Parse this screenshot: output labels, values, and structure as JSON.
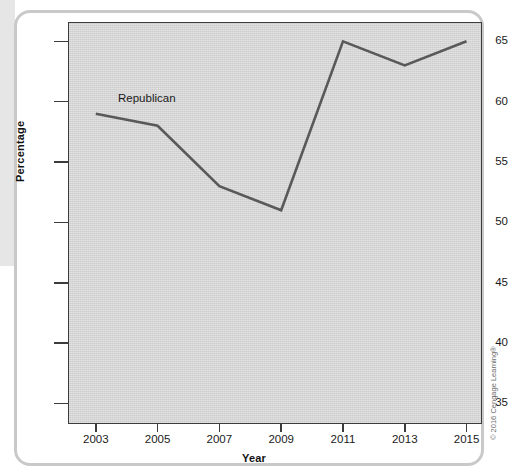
{
  "chart_data": {
    "type": "line",
    "title": "",
    "xlabel": "Year",
    "ylabel": "Percentage",
    "x": [
      2003,
      2005,
      2007,
      2009,
      2011,
      2013,
      2015
    ],
    "xtick_labels": [
      "2003",
      "2005",
      "2007",
      "2009",
      "2011",
      "2013",
      "2015"
    ],
    "ytick_labels": [
      "35",
      "40",
      "45",
      "50",
      "55",
      "60",
      "65"
    ],
    "yticks": [
      35,
      40,
      45,
      50,
      55,
      60,
      65
    ],
    "ylim": [
      33.3,
      66.6
    ],
    "xlim": [
      2002.1,
      2015.5
    ],
    "grid": false,
    "legend_position": "inline-annotation",
    "series": [
      {
        "name": "Republican",
        "label": "Republican",
        "color": "#595959",
        "values": [
          59,
          58,
          53,
          51,
          65,
          63,
          65
        ]
      }
    ]
  },
  "figure": {
    "plot_background_color": "#d4d4d4",
    "axis_color": "#3c3c3c",
    "card_border_color": "#c9c9c9",
    "page_bleed_color": "#e6e6e6",
    "annotation_label": "Republican",
    "y_axis_title": "Percentage",
    "x_axis_title": "Year",
    "copyright": "© 2016 Cengage Learning®"
  }
}
